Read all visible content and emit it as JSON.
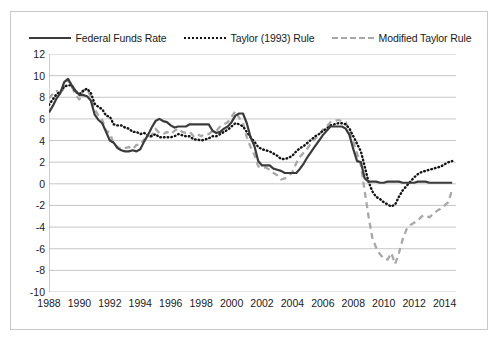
{
  "legend": {
    "position": "top-center",
    "items": [
      {
        "label": "Federal Funds Rate",
        "style": "solid",
        "color": "#3b3b3b",
        "icon": "solid-line-icon"
      },
      {
        "label": "Taylor (1993) Rule",
        "style": "dotted",
        "color": "#141414",
        "icon": "dotted-line-icon"
      },
      {
        "label": "Modified Taylor Rule",
        "style": "dashed",
        "color": "#a8a8a8",
        "icon": "dashed-line-icon"
      }
    ]
  },
  "colors": {
    "federal_funds_rate": "#3b3b3b",
    "taylor_1993_rule": "#141414",
    "modified_taylor_rule": "#a8a8a8",
    "gridline": "#bfbfbf",
    "border": "#c9c9c9",
    "text": "#1a1a1a"
  },
  "axes": {
    "y_ticks": [
      "12",
      "10",
      "8",
      "6",
      "4",
      "2",
      "0",
      "-2",
      "-4",
      "-6",
      "-8",
      "-10"
    ],
    "x_ticks": [
      "1988",
      "1990",
      "1992",
      "1994",
      "1996",
      "1998",
      "2000",
      "2002",
      "2004",
      "2006",
      "2008",
      "2010",
      "2012",
      "2014"
    ]
  },
  "chart_data": {
    "type": "line",
    "title": "",
    "subtitle": "",
    "xlabel": "",
    "ylabel": "",
    "xlim": [
      1988,
      2014.75
    ],
    "ylim": [
      -10,
      12
    ],
    "ytick_step": 2,
    "xtick_step": 2,
    "grid": "horizontal",
    "legend_position": "top-center",
    "x": [
      1988,
      1988.25,
      1988.5,
      1988.75,
      1989,
      1989.25,
      1989.5,
      1989.75,
      1990,
      1990.25,
      1990.5,
      1990.75,
      1991,
      1991.25,
      1991.5,
      1991.75,
      1992,
      1992.25,
      1992.5,
      1992.75,
      1993,
      1993.25,
      1993.5,
      1993.75,
      1994,
      1994.25,
      1994.5,
      1994.75,
      1995,
      1995.25,
      1995.5,
      1995.75,
      1996,
      1996.25,
      1996.5,
      1996.75,
      1997,
      1997.25,
      1997.5,
      1997.75,
      1998,
      1998.25,
      1998.5,
      1998.75,
      1999,
      1999.25,
      1999.5,
      1999.75,
      2000,
      2000.25,
      2000.5,
      2000.75,
      2001,
      2001.25,
      2001.5,
      2001.75,
      2002,
      2002.25,
      2002.5,
      2002.75,
      2003,
      2003.25,
      2003.5,
      2003.75,
      2004,
      2004.25,
      2004.5,
      2004.75,
      2005,
      2005.25,
      2005.5,
      2005.75,
      2006,
      2006.25,
      2006.5,
      2006.75,
      2007,
      2007.25,
      2007.5,
      2007.75,
      2008,
      2008.25,
      2008.5,
      2008.75,
      2009,
      2009.25,
      2009.5,
      2009.75,
      2010,
      2010.25,
      2010.5,
      2010.75,
      2011,
      2011.25,
      2011.5,
      2011.75,
      2012,
      2012.25,
      2012.5,
      2012.75,
      2013,
      2013.25,
      2013.5,
      2013.75,
      2014,
      2014.25,
      2014.5
    ],
    "series": [
      {
        "name": "Federal Funds Rate",
        "style": "solid",
        "color": "#3b3b3b",
        "values": [
          6.6,
          7.2,
          7.9,
          8.4,
          9.4,
          9.7,
          9.1,
          8.6,
          8.2,
          8.2,
          8.1,
          7.7,
          6.4,
          5.9,
          5.6,
          4.8,
          4.0,
          3.8,
          3.3,
          3.1,
          3.0,
          3.0,
          3.1,
          3.0,
          3.2,
          3.9,
          4.5,
          5.2,
          5.8,
          6.0,
          5.8,
          5.7,
          5.4,
          5.2,
          5.3,
          5.3,
          5.3,
          5.5,
          5.5,
          5.5,
          5.5,
          5.5,
          5.5,
          4.9,
          4.7,
          4.8,
          5.1,
          5.3,
          5.7,
          6.3,
          6.5,
          6.5,
          5.6,
          4.3,
          3.5,
          2.1,
          1.7,
          1.7,
          1.7,
          1.4,
          1.3,
          1.2,
          1.0,
          1.0,
          1.0,
          1.0,
          1.4,
          1.9,
          2.5,
          3.0,
          3.5,
          4.0,
          4.5,
          4.9,
          5.3,
          5.3,
          5.3,
          5.3,
          5.1,
          4.5,
          3.2,
          2.1,
          2.0,
          0.5,
          0.2,
          0.2,
          0.2,
          0.1,
          0.1,
          0.2,
          0.2,
          0.2,
          0.2,
          0.1,
          0.1,
          0.1,
          0.1,
          0.2,
          0.2,
          0.2,
          0.1,
          0.1,
          0.1,
          0.1,
          0.1,
          0.1,
          0.1
        ]
      },
      {
        "name": "Taylor (1993) Rule",
        "style": "dotted",
        "color": "#141414",
        "values": [
          7.3,
          7.8,
          8.3,
          8.5,
          9.0,
          9.1,
          9.1,
          8.5,
          8.3,
          8.6,
          8.8,
          8.4,
          7.4,
          7.1,
          6.9,
          6.3,
          6.2,
          5.5,
          5.4,
          5.4,
          5.2,
          5.1,
          4.8,
          4.8,
          4.6,
          4.7,
          4.5,
          4.4,
          4.6,
          4.3,
          4.3,
          4.3,
          4.3,
          4.4,
          4.6,
          4.5,
          4.4,
          4.4,
          4.1,
          4.1,
          4.0,
          4.1,
          4.2,
          4.4,
          4.4,
          4.6,
          4.8,
          5.0,
          5.3,
          5.6,
          5.5,
          5.3,
          4.8,
          4.3,
          3.9,
          3.4,
          3.2,
          3.1,
          3.0,
          2.8,
          2.6,
          2.3,
          2.3,
          2.4,
          2.6,
          3.0,
          3.3,
          3.5,
          3.8,
          4.1,
          4.4,
          4.6,
          4.9,
          5.1,
          5.4,
          5.5,
          5.6,
          5.6,
          5.5,
          5.1,
          4.4,
          3.7,
          3.0,
          1.6,
          0.2,
          -0.7,
          -1.2,
          -1.4,
          -1.7,
          -1.9,
          -2.1,
          -1.9,
          -1.2,
          -0.6,
          -0.2,
          0.2,
          0.6,
          0.9,
          1.1,
          1.2,
          1.3,
          1.4,
          1.5,
          1.6,
          1.8,
          2.0,
          2.1
        ]
      },
      {
        "name": "Modified Taylor Rule",
        "style": "dashed",
        "color": "#a8a8a8",
        "values": [
          7.9,
          8.3,
          8.6,
          8.2,
          9.0,
          9.6,
          9.0,
          8.2,
          7.8,
          8.6,
          8.8,
          8.0,
          6.9,
          6.3,
          5.9,
          4.9,
          4.7,
          3.7,
          3.4,
          3.2,
          3.3,
          3.4,
          3.2,
          3.6,
          3.6,
          4.1,
          4.1,
          4.5,
          5.1,
          4.7,
          4.6,
          4.8,
          4.6,
          4.9,
          5.1,
          4.8,
          4.7,
          4.8,
          4.4,
          4.6,
          4.4,
          4.6,
          4.6,
          4.9,
          4.9,
          5.3,
          5.5,
          5.7,
          6.2,
          6.7,
          6.1,
          5.6,
          4.3,
          3.4,
          2.7,
          1.6,
          1.5,
          1.5,
          1.3,
          1.0,
          0.8,
          0.4,
          0.5,
          0.7,
          1.1,
          1.9,
          2.5,
          2.9,
          3.3,
          3.8,
          4.2,
          4.5,
          5.0,
          5.3,
          5.7,
          5.8,
          5.9,
          5.8,
          5.7,
          4.9,
          3.9,
          2.8,
          1.7,
          -0.7,
          -3.0,
          -5.0,
          -5.9,
          -6.5,
          -6.9,
          -7.0,
          -6.4,
          -7.4,
          -6.4,
          -5.1,
          -4.2,
          -3.8,
          -3.6,
          -3.4,
          -3.0,
          -2.9,
          -3.1,
          -2.8,
          -2.5,
          -2.3,
          -2.0,
          -1.7,
          -0.5
        ]
      }
    ]
  }
}
